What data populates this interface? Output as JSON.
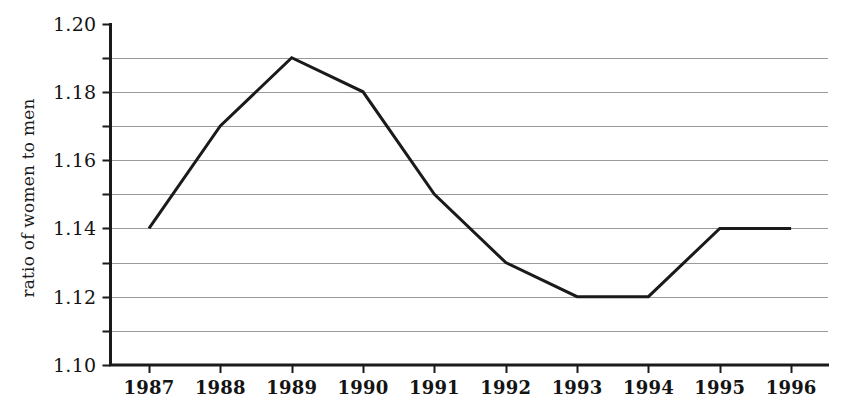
{
  "chart_data": {
    "type": "line",
    "title": "",
    "subtitle": "",
    "xlabel": "",
    "ylabel": "ratio of women to men",
    "categories": [
      "1987",
      "1988",
      "1989",
      "1990",
      "1991",
      "1992",
      "1993",
      "1994",
      "1995",
      "1996"
    ],
    "x": [
      1987,
      1988,
      1989,
      1990,
      1991,
      1992,
      1993,
      1994,
      1995,
      1996
    ],
    "values": [
      1.14,
      1.17,
      1.19,
      1.18,
      1.15,
      1.13,
      1.12,
      1.12,
      1.14,
      1.14
    ],
    "series": [
      {
        "name": "ratio of women to men",
        "values": [
          1.14,
          1.17,
          1.19,
          1.18,
          1.15,
          1.13,
          1.12,
          1.12,
          1.14,
          1.14
        ]
      }
    ],
    "ylim": [
      1.1,
      1.2
    ],
    "xlim": [
      1987,
      1996
    ],
    "ytick_labels": [
      "1.10",
      "1.12",
      "1.14",
      "1.16",
      "1.18",
      "1.20"
    ],
    "ytick_values": [
      1.1,
      1.12,
      1.14,
      1.16,
      1.18,
      1.2
    ],
    "yminor_tick_values": [
      1.11,
      1.13,
      1.15,
      1.17,
      1.19
    ],
    "xtick_labels": [
      "1987",
      "1988",
      "1989",
      "1990",
      "1991",
      "1992",
      "1993",
      "1994",
      "1995",
      "1996"
    ],
    "grid": "horizontal",
    "grid_values": [
      1.11,
      1.12,
      1.13,
      1.14,
      1.15,
      1.16,
      1.17,
      1.18,
      1.19
    ],
    "legend": "none",
    "legend_position": "none",
    "annotations": [],
    "line_color": "#1a1a1a",
    "line_width": 3,
    "grid_color": "#9a9a9a",
    "axis_color": "#1a1a1a",
    "background_color": "#ffffff",
    "markers": "none"
  }
}
